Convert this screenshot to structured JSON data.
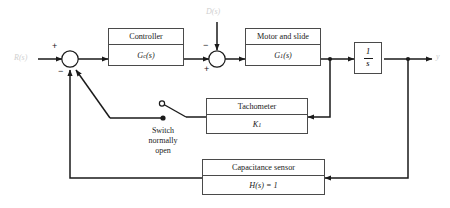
{
  "diagram": {
    "type": "control-system-block-diagram",
    "colors": {
      "line": "#1a1a1a",
      "block_border": "#4a4a4a",
      "background": "#ffffff",
      "faint_label": "#cfcfcf"
    }
  },
  "signals": {
    "input_label": "R(s)",
    "disturbance_label": "D(s)",
    "output_label": "y"
  },
  "summing_junctions": [
    {
      "name": "input-sum",
      "signs": {
        "input": "+",
        "feedback_outer": "−",
        "feedback_inner": "−"
      }
    },
    {
      "name": "disturbance-sum",
      "signs": {
        "disturbance": "−",
        "forward": "+"
      }
    }
  ],
  "blocks": [
    {
      "name": "controller",
      "title": "Controller",
      "transfer": "G",
      "transfer_sub": "c",
      "transfer_tail": "(s)"
    },
    {
      "name": "motor-and-slide",
      "title": "Motor and slide",
      "transfer": "G",
      "transfer_sub": "1",
      "transfer_tail": "(s)"
    },
    {
      "name": "integrator",
      "numerator": "1",
      "denominator": "s"
    },
    {
      "name": "tachometer",
      "title": "Tachometer",
      "transfer": "K",
      "transfer_sub": "1",
      "transfer_tail": ""
    },
    {
      "name": "capacitance-sensor",
      "title": "Capacitance sensor",
      "transfer": "H",
      "transfer_sub": "",
      "transfer_tail": "(s) = 1"
    }
  ],
  "switch": {
    "name": "tachometer-switch",
    "state": "open",
    "caption_line1": "Switch",
    "caption_line2": "normally",
    "caption_line3": "open"
  }
}
